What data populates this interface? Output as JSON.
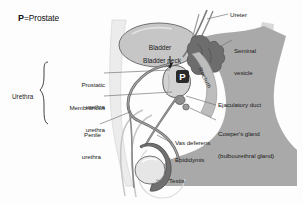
{
  "figure": {
    "legend": {
      "symbol": "P",
      "equals": "=",
      "meaning": "Prostate"
    },
    "marker": {
      "prostate_symbol": "P"
    }
  },
  "group_labels": {
    "urethra": "Urethra"
  },
  "labels": {
    "ureter": "Ureter",
    "seminal_vesicle_line1": "Seminal",
    "seminal_vesicle_line2": "vesicle",
    "bladder": "Bladder",
    "bladder_neck": "Bladder neck",
    "rectum": "Rectum",
    "prostatic_urethra_line1": "Prostatic",
    "prostatic_urethra_line2": "urethra",
    "membranous_urethra_line1": "Membranous",
    "membranous_urethra_line2": "urethra",
    "penile_urethra_line1": "Penile",
    "penile_urethra_line2": "urethra",
    "ejaculatory_duct": "Ejaculatory duct",
    "cowpers_gland_line1": "Cowper's gland",
    "cowpers_gland_line2": "(bulbourethral gland)",
    "vas_deferens": "Vas deferens",
    "epididymis": "Epididymis",
    "testis": "Testis"
  },
  "colors": {
    "background": "#fdfdfd",
    "body_mass": "#a9a9a9",
    "body_mass_light": "#cfcfcf",
    "bladder_fill": "#c4c4c4",
    "organ_dark": "#6a6a6a",
    "organ_darker": "#4a4a4a",
    "prostate_marker": "#2a2a2a",
    "outline": "#5a5a5a",
    "leader_line": "#6e6e6e",
    "text": "#1b1b1b"
  }
}
